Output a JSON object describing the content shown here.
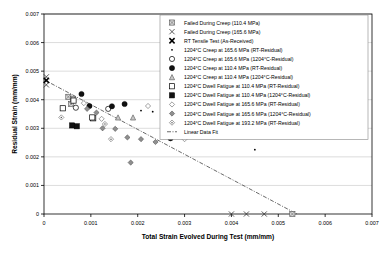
{
  "chart_data": {
    "type": "scatter",
    "title": "",
    "xlabel": "Total Strain Evolved During Test (mm/mm)",
    "ylabel": "Residual Strain (mm/mm)",
    "xlim": [
      0,
      0.007
    ],
    "ylim": [
      0,
      0.007
    ],
    "xticks": [
      "0",
      "0.001",
      "0.002",
      "0.003",
      "0.004",
      "0.005",
      "0.006",
      "0.007"
    ],
    "yticks": [
      "0",
      "0.001",
      "0.002",
      "0.003",
      "0.004",
      "0.005",
      "0.006",
      "0.007"
    ],
    "xtick_values": [
      0,
      0.001,
      0.002,
      0.003,
      0.004,
      0.005,
      0.006,
      0.007
    ],
    "ytick_values": [
      0,
      0.001,
      0.002,
      0.003,
      0.004,
      0.005,
      0.006,
      0.007
    ],
    "grid": true,
    "legend_position": "upper-right",
    "series": [
      {
        "name": "Failed During Creep (110.4 MPa)",
        "marker": "square-crossed",
        "color": "#808080",
        "points": [
          {
            "x": 0.00052,
            "y": 0.0041
          },
          {
            "x": 0.00062,
            "y": 0.00403
          },
          {
            "x": 0.00058,
            "y": 0.00385
          },
          {
            "x": 0.0053,
            "y": 0.0
          }
        ]
      },
      {
        "name": "Failed During Creep (165.6 MPa)",
        "marker": "x-thin",
        "color": "#333333",
        "points": [
          {
            "x": 5e-05,
            "y": 0.0048
          },
          {
            "x": 5e-05,
            "y": 0.00452
          },
          {
            "x": 0.004,
            "y": 0.0
          },
          {
            "x": 0.00432,
            "y": 0.0
          },
          {
            "x": 0.0047,
            "y": 0.0
          }
        ]
      },
      {
        "name": "RT Tensile Test (As-Received)",
        "marker": "x-bold",
        "color": "#000000",
        "points": [
          {
            "x": 5e-05,
            "y": 0.00468
          }
        ]
      },
      {
        "name": "1204°C Creep at 165.6 MPa (RT-Residual)",
        "marker": "dot",
        "color": "#000000",
        "points": [
          {
            "x": 0.00207,
            "y": 0.00362
          },
          {
            "x": 0.00232,
            "y": 0.00358
          },
          {
            "x": 0.0039,
            "y": 0.00285
          },
          {
            "x": 0.0045,
            "y": 0.00225
          }
        ]
      },
      {
        "name": "1204°C Creep at 165.6 MPa (1204°C-Residual)",
        "marker": "circle-open",
        "color": "#000000",
        "points": [
          {
            "x": 0.00068,
            "y": 0.00372
          },
          {
            "x": 0.00137,
            "y": 0.00368
          },
          {
            "x": 0.00288,
            "y": 0.00305
          },
          {
            "x": 0.00327,
            "y": 0.00282
          }
        ]
      },
      {
        "name": "1204°C Creep at 110.4 MPa (RT-Residual)",
        "marker": "circle-filled",
        "color": "#000000",
        "points": [
          {
            "x": 0.0008,
            "y": 0.0042
          },
          {
            "x": 0.00097,
            "y": 0.00378
          },
          {
            "x": 0.00145,
            "y": 0.00377
          },
          {
            "x": 0.00172,
            "y": 0.00385
          },
          {
            "x": 0.0027,
            "y": 0.00265
          }
        ]
      },
      {
        "name": "1204°C Creep at 110.4 MPa (1204°C-Residual)",
        "marker": "triangle-open",
        "color": "#808080",
        "points": [
          {
            "x": 0.00158,
            "y": 0.00338
          },
          {
            "x": 0.0019,
            "y": 0.00338
          }
        ]
      },
      {
        "name": "1204°C Dwell Fatigue at 110.4 MPa (RT-Residual)",
        "marker": "square-open",
        "color": "#000000",
        "points": [
          {
            "x": 0.0004,
            "y": 0.0037
          },
          {
            "x": 0.00063,
            "y": 0.00397
          },
          {
            "x": 0.00105,
            "y": 0.00335
          },
          {
            "x": 0.00103,
            "y": 0.00338
          }
        ]
      },
      {
        "name": "1204°C Dwell Fatigue at 110.4 MPa (1204°C-Residual)",
        "marker": "square-filled",
        "color": "#000000",
        "points": [
          {
            "x": 0.0007,
            "y": 0.00307
          },
          {
            "x": 0.0006,
            "y": 0.0031
          }
        ]
      },
      {
        "name": "1204°C Dwell Fatigue at 165.6 MPa (RT-Residual)",
        "marker": "diamond-open",
        "color": "#999999",
        "points": [
          {
            "x": 0.00085,
            "y": 0.00388
          },
          {
            "x": 0.00222,
            "y": 0.00378
          },
          {
            "x": 0.00123,
            "y": 0.00333
          },
          {
            "x": 0.00258,
            "y": 0.00325
          },
          {
            "x": 0.00332,
            "y": 0.00308
          },
          {
            "x": 0.003,
            "y": 0.00262
          }
        ]
      },
      {
        "name": "1204°C Dwell Fatigue at 165.6 MPa (1204°C-Residual)",
        "marker": "diamond-filled",
        "color": "#6e6e6e",
        "points": [
          {
            "x": 0.00092,
            "y": 0.00368
          },
          {
            "x": 0.00112,
            "y": 0.00355
          },
          {
            "x": 0.00125,
            "y": 0.003
          },
          {
            "x": 0.00152,
            "y": 0.00298
          },
          {
            "x": 0.00178,
            "y": 0.00268
          },
          {
            "x": 0.00207,
            "y": 0.00262
          },
          {
            "x": 0.00238,
            "y": 0.00252
          },
          {
            "x": 0.00185,
            "y": 0.0018
          }
        ]
      },
      {
        "name": "1204°C Dwell Fatigue at 193.2 MPa (RT-Residual)",
        "marker": "diamond-dotted",
        "color": "#8a8a8a",
        "points": [
          {
            "x": 0.00037,
            "y": 0.00338
          },
          {
            "x": 0.0013,
            "y": 0.00315
          },
          {
            "x": 0.00143,
            "y": 0.00262
          }
        ]
      },
      {
        "name": "Linear Data Fit",
        "marker": "dashdot-line",
        "color": "#444444",
        "line": {
          "x1": 0.0,
          "y1": 0.0047,
          "x2": 0.0054,
          "y2": 0.0
        }
      }
    ]
  },
  "legend": {
    "items": [
      {
        "label": "Failed During Creep (110.4 MPa)",
        "marker": "square-crossed"
      },
      {
        "label": "Failed During Creep (165.6 MPa)",
        "marker": "x-thin"
      },
      {
        "label": "RT Tensile Test (As-Received)",
        "marker": "x-bold"
      },
      {
        "label": "1204°C Creep at 165.6 MPa (RT-Residual)",
        "marker": "dot"
      },
      {
        "label": "1204°C Creep at 165.6 MPa (1204°C-Residual)",
        "marker": "circle-open"
      },
      {
        "label": "1204°C Creep at 110.4 MPa (RT-Residual)",
        "marker": "circle-filled"
      },
      {
        "label": "1204°C Creep at 110.4 MPa (1204°C-Residual)",
        "marker": "triangle-open"
      },
      {
        "label": "1204°C Dwell Fatigue at 110.4 MPa (RT-Residual)",
        "marker": "square-open"
      },
      {
        "label": "1204°C Dwell Fatigue at 110.4 MPa (1204°C-Residual)",
        "marker": "square-filled"
      },
      {
        "label": "1204°C Dwell Fatigue at 165.6 MPa (RT-Residual)",
        "marker": "diamond-open"
      },
      {
        "label": "1204°C Dwell Fatigue at 165.6 MPa (1204°C-Residual)",
        "marker": "diamond-filled"
      },
      {
        "label": "1204°C Dwell Fatigue at 193.2 MPa (RT-Residual)",
        "marker": "diamond-dotted"
      },
      {
        "label": "Linear Data Fit",
        "marker": "dashdot-line"
      }
    ]
  }
}
